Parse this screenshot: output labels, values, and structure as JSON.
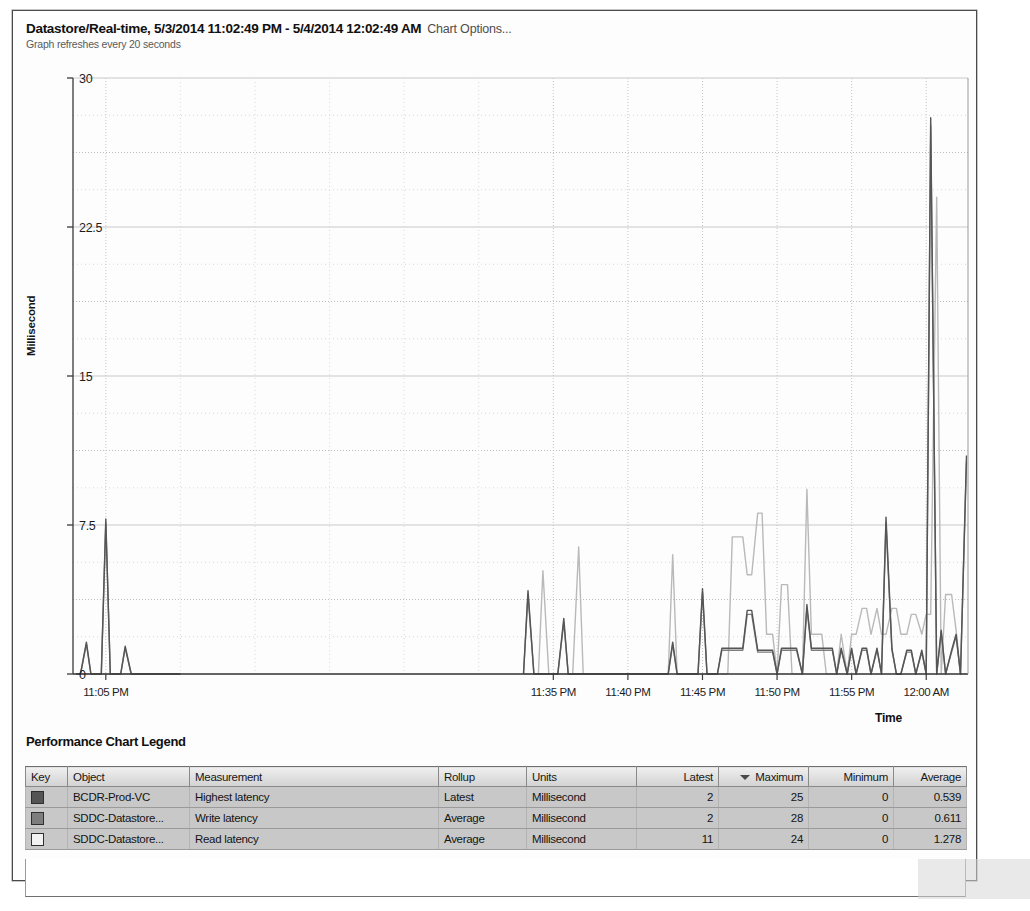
{
  "header": {
    "title": "Datastore/Real-time, 5/3/2014 11:02:49 PM - 5/4/2014 12:02:49 AM",
    "chart_options_label": "Chart Options...",
    "refresh_note": "Graph refreshes every 20 seconds"
  },
  "legend": {
    "title": "Performance Chart Legend",
    "columns": [
      {
        "label": "Key",
        "align": "left",
        "sorted": false
      },
      {
        "label": "Object",
        "align": "left",
        "sorted": false
      },
      {
        "label": "Measurement",
        "align": "left",
        "sorted": false
      },
      {
        "label": "Rollup",
        "align": "left",
        "sorted": false
      },
      {
        "label": "Units",
        "align": "left",
        "sorted": false
      },
      {
        "label": "Latest",
        "align": "right",
        "sorted": false
      },
      {
        "label": "Maximum",
        "align": "right",
        "sorted": true
      },
      {
        "label": "Minimum",
        "align": "right",
        "sorted": false
      },
      {
        "label": "Average",
        "align": "right",
        "sorted": false
      }
    ],
    "sort_column": "Maximum",
    "sort_direction": "descending",
    "rows": [
      {
        "key_color": "#555555",
        "object": "BCDR-Prod-VC",
        "measurement": "Highest latency",
        "rollup": "Latest",
        "units": "Millisecond",
        "latest": "2",
        "maximum": "25",
        "minimum": "0",
        "average": "0.539"
      },
      {
        "key_color": "#7d7d7d",
        "object": "SDDC-Datastore...",
        "measurement": "Write latency",
        "rollup": "Average",
        "units": "Millisecond",
        "latest": "2",
        "maximum": "28",
        "minimum": "0",
        "average": "0.611"
      },
      {
        "key_color": "#f2f2f2",
        "object": "SDDC-Datastore...",
        "measurement": "Read latency",
        "rollup": "Average",
        "units": "Millisecond",
        "latest": "11",
        "maximum": "24",
        "minimum": "0",
        "average": "1.278"
      }
    ]
  },
  "chart_data": {
    "type": "line",
    "title": "Datastore/Real-time, 5/3/2014 11:02:49 PM - 5/4/2014 12:02:49 AM",
    "xlabel": "Time",
    "ylabel": "Millisecond",
    "ylim": [
      0,
      30
    ],
    "yticks": [
      0,
      7.5,
      15,
      22.5,
      30
    ],
    "ytick_labels": [
      "0",
      "7.5",
      "15",
      "22.5",
      "30"
    ],
    "xtick_labels": [
      "11:05 PM",
      "11:35 PM",
      "11:40 PM",
      "11:45 PM",
      "11:50 PM",
      "11:55 PM",
      "12:00 AM"
    ],
    "xtick_minutes": [
      5,
      35,
      40,
      45,
      50,
      55,
      60
    ],
    "xlim_minutes": [
      2.8,
      62.8
    ],
    "grid": true,
    "legend_position": "below-table",
    "series": [
      {
        "name": "Highest latency",
        "object": "BCDR-Prod-VC",
        "color": "#555555",
        "x_minutes": [
          3.0,
          3.3,
          3.7,
          4.0,
          4.3,
          4.7,
          5.0,
          5.3,
          5.7,
          6.0,
          6.3,
          6.7,
          7.0,
          7.3,
          7.7,
          8.0,
          8.3,
          8.7,
          9.0,
          9.3,
          9.7,
          10.0,
          33.0,
          33.3,
          33.7,
          34.0,
          34.3,
          34.7,
          35.0,
          35.3,
          35.7,
          36.0,
          36.3,
          36.7,
          37.0,
          37.3,
          37.7,
          38.0,
          38.3,
          38.7,
          39.0,
          39.3,
          39.7,
          40.0,
          40.3,
          40.7,
          41.0,
          41.3,
          41.7,
          42.0,
          42.3,
          42.7,
          43.0,
          43.3,
          43.7,
          44.0,
          44.3,
          44.7,
          45.0,
          45.3,
          45.7,
          46.0,
          46.3,
          46.7,
          47.0,
          47.3,
          47.7,
          48.0,
          48.3,
          48.7,
          49.0,
          49.3,
          49.7,
          50.0,
          50.3,
          50.7,
          51.0,
          51.3,
          51.7,
          52.0,
          52.3,
          52.7,
          53.0,
          53.3,
          53.7,
          54.0,
          54.3,
          54.7,
          55.0,
          55.3,
          55.7,
          56.0,
          56.3,
          56.7,
          57.0,
          57.3,
          57.7,
          58.0,
          58.3,
          58.7,
          59.0,
          59.3,
          59.7,
          60.0,
          60.3,
          60.7,
          61.0,
          61.3,
          61.7,
          62.0,
          62.3,
          62.7
        ],
        "y_values": [
          0,
          0,
          1.6,
          0,
          0,
          0,
          7.8,
          0,
          0,
          0,
          1.4,
          0,
          0,
          0,
          0,
          0,
          0,
          0,
          0,
          0,
          0,
          0,
          0,
          4.2,
          0,
          0,
          0,
          0,
          0,
          0,
          2.8,
          0,
          0,
          0,
          0,
          0,
          0,
          0,
          0,
          0,
          0,
          0,
          0,
          0,
          0,
          0,
          0,
          0,
          0,
          0,
          0,
          0,
          1.6,
          0,
          0,
          0,
          0,
          0,
          4.3,
          0,
          0,
          0,
          1.3,
          1.3,
          1.3,
          1.3,
          1.3,
          3.2,
          3.2,
          1.2,
          1.2,
          1.2,
          1.2,
          0,
          1.3,
          1.3,
          1.3,
          1.3,
          0,
          3.5,
          1.3,
          1.3,
          1.3,
          1.3,
          1.3,
          0,
          1.3,
          0,
          1.3,
          0,
          1.3,
          1.3,
          0,
          1.3,
          0,
          7.9,
          1.3,
          0,
          0,
          1.2,
          1.2,
          0,
          1.2,
          0,
          28.0,
          0,
          2.2,
          0,
          1.2,
          2.0,
          0,
          11.0
        ]
      },
      {
        "name": "Write latency",
        "object": "SDDC-Datastore...",
        "color": "#7d7d7d",
        "x_minutes": [
          3.0,
          3.3,
          3.7,
          4.0,
          4.3,
          4.7,
          5.0,
          5.3,
          5.7,
          6.0,
          6.3,
          6.7,
          7.0,
          7.3,
          7.7,
          8.0,
          8.3,
          8.7,
          9.0,
          9.3,
          9.7,
          10.0,
          33.0,
          33.3,
          33.7,
          34.0,
          34.3,
          34.7,
          35.0,
          35.3,
          35.7,
          36.0,
          36.3,
          36.7,
          37.0,
          37.3,
          37.7,
          38.0,
          38.3,
          38.7,
          39.0,
          39.3,
          39.7,
          40.0,
          40.3,
          40.7,
          41.0,
          41.3,
          41.7,
          42.0,
          42.3,
          42.7,
          43.0,
          43.3,
          43.7,
          44.0,
          44.3,
          44.7,
          45.0,
          45.3,
          45.7,
          46.0,
          46.3,
          46.7,
          47.0,
          47.3,
          47.7,
          48.0,
          48.3,
          48.7,
          49.0,
          49.3,
          49.7,
          50.0,
          50.3,
          50.7,
          51.0,
          51.3,
          51.7,
          52.0,
          52.3,
          52.7,
          53.0,
          53.3,
          53.7,
          54.0,
          54.3,
          54.7,
          55.0,
          55.3,
          55.7,
          56.0,
          56.3,
          56.7,
          57.0,
          57.3,
          57.7,
          58.0,
          58.3,
          58.7,
          59.0,
          59.3,
          59.7,
          60.0,
          60.3,
          60.7,
          61.0,
          61.3,
          61.7,
          62.0,
          62.3,
          62.7
        ],
        "y_values": [
          0,
          0,
          1.5,
          0,
          0,
          0,
          7.6,
          0,
          0,
          0,
          1.3,
          0,
          0,
          0,
          0,
          0,
          0,
          0,
          0,
          0,
          0,
          0,
          0,
          4.0,
          0,
          0,
          0,
          0,
          0,
          0,
          2.6,
          0,
          0,
          0,
          0,
          0,
          0,
          0,
          0,
          0,
          0,
          0,
          0,
          0,
          0,
          0,
          0,
          0,
          0,
          0,
          0,
          0,
          1.5,
          0,
          0,
          0,
          0,
          0,
          4.1,
          0,
          0,
          0,
          1.2,
          1.2,
          1.2,
          1.2,
          1.2,
          3.0,
          3.0,
          1.1,
          1.1,
          1.1,
          1.1,
          0,
          1.2,
          1.2,
          1.2,
          1.2,
          0,
          3.3,
          1.2,
          1.2,
          1.2,
          1.2,
          1.2,
          0,
          1.2,
          0,
          1.2,
          0,
          1.2,
          1.2,
          0,
          1.2,
          0,
          7.6,
          1.2,
          0,
          0,
          1.1,
          1.1,
          0,
          1.1,
          0,
          27.6,
          0,
          2.1,
          0,
          1.1,
          1.9,
          0,
          10.7
        ]
      },
      {
        "name": "Read latency",
        "object": "SDDC-Datastore...",
        "color": "#b9b9b9",
        "x_minutes": [
          3.0,
          3.3,
          3.7,
          4.0,
          4.3,
          4.7,
          5.0,
          5.3,
          5.7,
          6.0,
          6.3,
          6.7,
          7.0,
          7.3,
          7.7,
          8.0,
          8.3,
          8.7,
          9.0,
          9.3,
          9.7,
          10.0,
          33.0,
          33.3,
          33.7,
          34.0,
          34.3,
          34.7,
          35.0,
          35.3,
          35.7,
          36.0,
          36.3,
          36.7,
          37.0,
          37.3,
          37.7,
          38.0,
          38.3,
          38.7,
          39.0,
          39.3,
          39.7,
          40.0,
          40.3,
          40.7,
          41.0,
          41.3,
          41.7,
          42.0,
          42.3,
          42.7,
          43.0,
          43.3,
          43.7,
          44.0,
          44.3,
          44.7,
          45.0,
          45.3,
          45.7,
          46.0,
          46.3,
          46.7,
          47.0,
          47.3,
          47.7,
          48.0,
          48.3,
          48.7,
          49.0,
          49.3,
          49.7,
          50.0,
          50.3,
          50.7,
          51.0,
          51.3,
          51.7,
          52.0,
          52.3,
          52.7,
          53.0,
          53.3,
          53.7,
          54.0,
          54.3,
          54.7,
          55.0,
          55.3,
          55.7,
          56.0,
          56.3,
          56.7,
          57.0,
          57.3,
          57.7,
          58.0,
          58.3,
          58.7,
          59.0,
          59.3,
          59.7,
          60.0,
          60.3,
          60.7,
          61.0,
          61.3,
          61.7,
          62.0,
          62.3,
          62.7
        ],
        "y_values": [
          0,
          0,
          0,
          0,
          0,
          0,
          0,
          0,
          0,
          0,
          0,
          0,
          0,
          0,
          0,
          0,
          0,
          0,
          0,
          0,
          0,
          0,
          0,
          0,
          0,
          0,
          5.2,
          0,
          0,
          0,
          0,
          0,
          0,
          6.4,
          0,
          0,
          0,
          0,
          0,
          0,
          0,
          0,
          0,
          0,
          0,
          0,
          0,
          0,
          0,
          0,
          0,
          0,
          6.0,
          0,
          0,
          0,
          0,
          0,
          0,
          0,
          0,
          0,
          0,
          0,
          6.9,
          6.9,
          6.9,
          5.0,
          5.0,
          8.1,
          8.1,
          2.0,
          2.0,
          0,
          4.5,
          4.5,
          0,
          0,
          0,
          9.3,
          2.0,
          2.0,
          2.0,
          0,
          0,
          0,
          2.0,
          0,
          2.0,
          2.0,
          3.3,
          3.3,
          2.0,
          3.3,
          2.0,
          2.0,
          3.3,
          3.3,
          2.0,
          2.0,
          3.0,
          3.0,
          2.0,
          3.0,
          3.0,
          24.0,
          0,
          4.0,
          4.0,
          2.2,
          0,
          0,
          0
        ]
      }
    ]
  }
}
